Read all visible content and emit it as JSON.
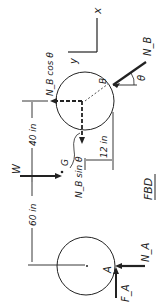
{
  "diagram": {
    "title": "FBD",
    "axes": {
      "x_label": "x",
      "y_label": "y"
    },
    "points": {
      "B": "B",
      "G": "G",
      "A": "A"
    },
    "angle": "θ",
    "forces": {
      "NB": "N_B",
      "NB_cos": "N_B cos θ",
      "NB_sin": "N_B sin θ",
      "W": "W",
      "NA": "N_A",
      "FA": "F_A"
    },
    "dimensions": {
      "d40": "40 in",
      "d60": "60 in",
      "d12": "12 in"
    },
    "colors": {
      "ink": "#222222",
      "background": "#ffffff"
    }
  }
}
